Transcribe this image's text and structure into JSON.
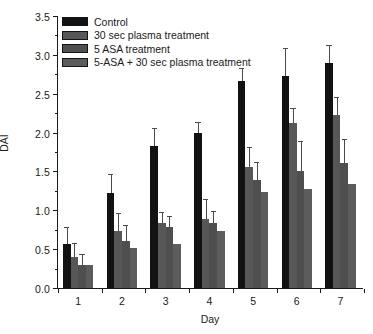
{
  "chart_data": {
    "type": "bar",
    "title": "",
    "subtitle": "",
    "xlabel": "Day",
    "ylabel": "DAI",
    "categories": [
      "1",
      "2",
      "3",
      "4",
      "5",
      "6",
      "7"
    ],
    "ylim": [
      0.0,
      3.5
    ],
    "ytick_labels": [
      "0.0",
      "0.5",
      "1.0",
      "1.5",
      "2.0",
      "2.5",
      "3.0",
      "3.5"
    ],
    "ytick_values": [
      0.0,
      0.5,
      1.0,
      1.5,
      2.0,
      2.5,
      3.0,
      3.5
    ],
    "ytick_minor_step": 0.25,
    "grid": false,
    "legend_position": "top-left",
    "error_bars": "upper-only-with-caps",
    "series": [
      {
        "name": "Control",
        "color": "#121212",
        "values": [
          0.56,
          1.22,
          1.83,
          2.0,
          2.67,
          2.73,
          2.89
        ],
        "errors": [
          0.21,
          0.23,
          0.22,
          0.12,
          0.15,
          0.35,
          0.22
        ]
      },
      {
        "name": "30 sec plasma treatment",
        "color": "#575757",
        "values": [
          0.4,
          0.73,
          0.84,
          0.89,
          1.56,
          2.12,
          2.22
        ],
        "errors": [
          0.17,
          0.22,
          0.13,
          0.24,
          0.24,
          0.18,
          0.23
        ]
      },
      {
        "name": "5 ASA treatment",
        "color": "#4f4f4f",
        "values": [
          0.29,
          0.61,
          0.78,
          0.84,
          1.39,
          1.51,
          1.61
        ],
        "errors": [
          0.14,
          0.19,
          0.13,
          0.14,
          0.22,
          0.37,
          0.29
        ]
      },
      {
        "name": "5-ASA + 30 sec plasma treatment",
        "color": "#5c5c5c",
        "values": [
          0.29,
          0.51,
          0.56,
          0.73,
          1.23,
          1.28,
          1.34
        ]
      }
    ]
  },
  "legend": {
    "items": [
      {
        "label": "Control",
        "color": "#121212"
      },
      {
        "label": "30 sec plasma treatment",
        "color": "#575757"
      },
      {
        "label": "5 ASA treatment",
        "color": "#4f4f4f"
      },
      {
        "label": "5-ASA + 30 sec plasma treatment",
        "color": "#5c5c5c"
      }
    ]
  },
  "axes": {
    "y_title": "DAI",
    "x_title": "Day"
  },
  "colors": {
    "axis": "#1a1a1a",
    "background": "#ffffff",
    "error_bar": "#4a4a4a"
  }
}
